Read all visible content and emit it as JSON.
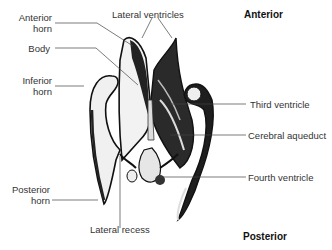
{
  "figure": {
    "orientation": {
      "top": "Anterior",
      "bottom": "Posterior"
    },
    "labels": {
      "anterior_horn": [
        "Anterior",
        "horn"
      ],
      "lateral_ventricles": "Lateral ventricles",
      "body": "Body",
      "inferior_horn": [
        "Inferior",
        "horn"
      ],
      "third_ventricle": "Third ventricle",
      "cerebral_aqueduct": "Cerebral aqueduct",
      "fourth_ventricle": "Fourth ventricle",
      "posterior_horn": [
        "Posterior",
        "horn"
      ],
      "lateral_recess": "Lateral recess"
    }
  }
}
